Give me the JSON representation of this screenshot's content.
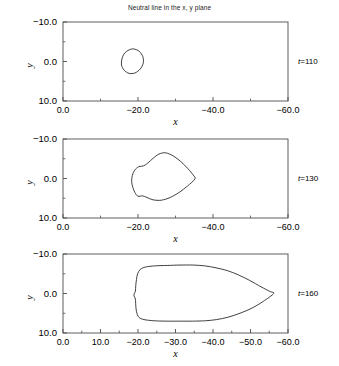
{
  "chart_data": {
    "type": "line",
    "title": "Neutral line in the x, y plane",
    "xlabel": "x",
    "ylabel": "y",
    "xlim": [
      0.0,
      -60.0
    ],
    "ylim": [
      -10.0,
      10.0
    ],
    "y_axis_inverted": true,
    "grid": false,
    "legend": "none",
    "panels": [
      {
        "annotation": "t=110",
        "time_symbol": "t",
        "time_value": "110",
        "xticks": [
          "0.0",
          "-20.0",
          "-40.0",
          "-60.0"
        ],
        "xtick_values": [
          0.0,
          -20.0,
          -40.0,
          -60.0
        ],
        "xminor_values": [
          -10.0,
          -30.0,
          -50.0
        ],
        "yticks": [
          "-10.0",
          "0.0",
          "10.0"
        ],
        "ytick_values": [
          -10.0,
          0.0,
          10.0
        ],
        "yminor_values": [
          -5.0,
          5.0
        ],
        "contour": [
          [
            -17.0,
            -2.6
          ],
          [
            -18.6,
            -3.2
          ],
          [
            -20.3,
            -2.6
          ],
          [
            -21.3,
            -1.2
          ],
          [
            -21.4,
            0.4
          ],
          [
            -20.6,
            1.9
          ],
          [
            -19.2,
            2.9
          ],
          [
            -17.6,
            3.0
          ],
          [
            -16.3,
            2.2
          ],
          [
            -15.6,
            0.9
          ],
          [
            -15.7,
            -0.6
          ],
          [
            -16.2,
            -1.8
          ],
          [
            -17.0,
            -2.6
          ]
        ]
      },
      {
        "annotation": "t=130",
        "time_symbol": "t",
        "time_value": "130",
        "xticks": [
          "0.0",
          "-20.0",
          "-40.0",
          "-60.0"
        ],
        "xtick_values": [
          0.0,
          -20.0,
          -40.0,
          -60.0
        ],
        "xminor_values": [
          -10.0,
          -30.0,
          -50.0
        ],
        "yticks": [
          "-10.0",
          "0.0",
          "10.0"
        ],
        "ytick_values": [
          -10.0,
          0.0,
          10.0
        ],
        "yminor_values": [
          -5.0,
          5.0
        ],
        "contour": [
          [
            -35.2,
            0.1
          ],
          [
            -33.2,
            1.9
          ],
          [
            -31.0,
            3.5
          ],
          [
            -28.6,
            4.8
          ],
          [
            -26.2,
            5.5
          ],
          [
            -24.0,
            5.4
          ],
          [
            -22.4,
            4.8
          ],
          [
            -21.2,
            4.4
          ],
          [
            -20.0,
            4.5
          ],
          [
            -19.2,
            3.6
          ],
          [
            -18.6,
            2.2
          ],
          [
            -18.3,
            0.7
          ],
          [
            -18.5,
            -0.8
          ],
          [
            -19.1,
            -2.1
          ],
          [
            -20.2,
            -3.0
          ],
          [
            -21.5,
            -3.2
          ],
          [
            -22.6,
            -3.9
          ],
          [
            -24.0,
            -5.1
          ],
          [
            -25.6,
            -6.2
          ],
          [
            -27.4,
            -6.5
          ],
          [
            -29.4,
            -5.7
          ],
          [
            -31.4,
            -4.3
          ],
          [
            -33.3,
            -2.5
          ],
          [
            -34.7,
            -0.9
          ],
          [
            -35.2,
            0.1
          ]
        ]
      },
      {
        "annotation": "t=160",
        "time_symbol": "t",
        "time_value": "160",
        "xticks": [
          "0.0",
          "10.0",
          "-20.0",
          "-30.0",
          "-40.0",
          "-50.0",
          "-60.0"
        ],
        "xtick_values": [
          0.0,
          -10.0,
          -20.0,
          -30.0,
          -40.0,
          -50.0,
          -60.0
        ],
        "xminor_values": [
          -5.0,
          -15.0,
          -25.0,
          -35.0,
          -45.0,
          -55.0
        ],
        "yticks": [
          "-10.0",
          "0.0",
          "10.0"
        ],
        "ytick_values": [
          -10.0,
          0.0,
          10.0
        ],
        "yminor_values": [
          -5.0,
          5.0
        ],
        "contour": [
          [
            -56.2,
            0.0
          ],
          [
            -53.4,
            2.0
          ],
          [
            -50.4,
            3.7
          ],
          [
            -47.2,
            5.0
          ],
          [
            -44.0,
            6.0
          ],
          [
            -41.0,
            6.6
          ],
          [
            -38.0,
            6.9
          ],
          [
            -34.5,
            7.0
          ],
          [
            -31.0,
            7.0
          ],
          [
            -27.5,
            7.0
          ],
          [
            -24.2,
            6.9
          ],
          [
            -21.6,
            6.6
          ],
          [
            -20.2,
            6.0
          ],
          [
            -19.6,
            4.6
          ],
          [
            -19.4,
            3.0
          ],
          [
            -19.3,
            1.4
          ],
          [
            -18.9,
            0.4
          ],
          [
            -19.3,
            -0.6
          ],
          [
            -19.4,
            -2.0
          ],
          [
            -19.6,
            -3.6
          ],
          [
            -19.9,
            -5.0
          ],
          [
            -20.6,
            -6.1
          ],
          [
            -22.0,
            -6.7
          ],
          [
            -24.6,
            -7.0
          ],
          [
            -27.8,
            -7.1
          ],
          [
            -31.2,
            -7.2
          ],
          [
            -34.6,
            -7.2
          ],
          [
            -37.8,
            -7.0
          ],
          [
            -40.8,
            -6.5
          ],
          [
            -43.8,
            -5.8
          ],
          [
            -46.8,
            -4.7
          ],
          [
            -49.8,
            -3.3
          ],
          [
            -52.8,
            -1.7
          ],
          [
            -55.2,
            -0.5
          ],
          [
            -56.2,
            0.0
          ]
        ]
      }
    ]
  }
}
